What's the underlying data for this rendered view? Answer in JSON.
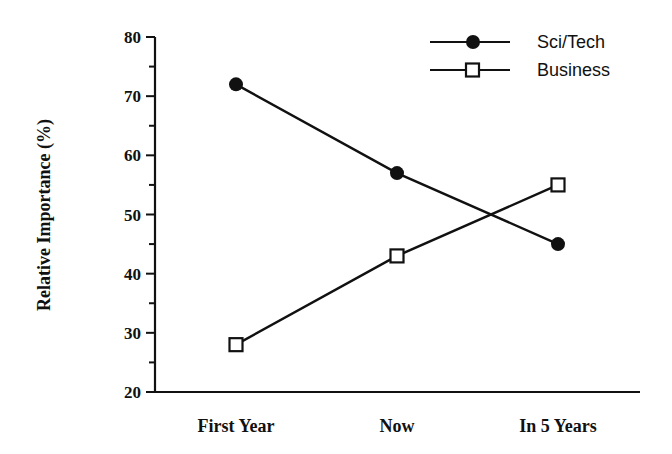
{
  "chart_data": {
    "type": "line",
    "title": "",
    "xlabel": "",
    "ylabel": "Relative Importance (%)",
    "categories": [
      "First Year",
      "Now",
      "In 5 Years"
    ],
    "ylim": [
      20,
      80
    ],
    "yticks": [
      20,
      30,
      40,
      50,
      60,
      70,
      80
    ],
    "minor_ticks_step": 5,
    "grid": false,
    "legend_position": "top-right",
    "series": [
      {
        "name": "Sci/Tech",
        "marker": "filled-circle",
        "values": [
          72,
          57,
          45
        ]
      },
      {
        "name": "Business",
        "marker": "open-square",
        "values": [
          28,
          43,
          55
        ]
      }
    ]
  },
  "colors": {
    "line": "#111111",
    "background": "#ffffff"
  }
}
